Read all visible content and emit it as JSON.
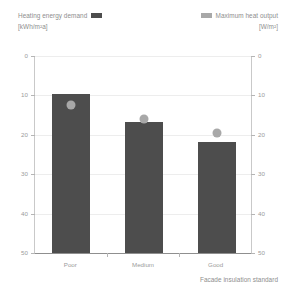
{
  "legend": {
    "left": {
      "label": "Heating energy demand",
      "unit": "[kWh/m²a]",
      "swatch_color": "#4d4d4d",
      "swatch_name": "bar-series-swatch"
    },
    "right": {
      "label": "Maximum heat output",
      "unit": "[W/m²]",
      "swatch_color": "#a8a8a8",
      "swatch_name": "point-series-swatch"
    }
  },
  "axes": {
    "x_title": "Facade insulation standard",
    "left_ticks": [
      "50",
      "40",
      "30",
      "20",
      "10",
      "0"
    ],
    "right_ticks": [
      "50",
      "40",
      "30",
      "20",
      "10",
      "0"
    ]
  },
  "categories": [
    "Poor",
    "Medium",
    "Good"
  ],
  "chart_data": {
    "type": "bar",
    "title": "",
    "subtitle": "",
    "xlabel": "Facade insulation standard",
    "ylabel": "Heating energy demand [kWh/m²a]",
    "y2label": "Maximum heat output [W/m²]",
    "categories": [
      "Poor",
      "Medium",
      "Good"
    ],
    "ylim": [
      0,
      50
    ],
    "y2lim": [
      0,
      50
    ],
    "yticks": [
      0,
      10,
      20,
      30,
      40,
      50
    ],
    "y2ticks": [
      0,
      10,
      20,
      30,
      40,
      50
    ],
    "grid": true,
    "legend_position": "top",
    "series": [
      {
        "name": "Heating energy demand",
        "unit": "kWh/m²a",
        "mark": "bar",
        "axis": "left",
        "color": "#4d4d4d",
        "values": [
          40.3,
          33.3,
          28.3
        ]
      },
      {
        "name": "Maximum heat output",
        "unit": "W/m²",
        "mark": "point",
        "axis": "right",
        "color": "#a8a8a8",
        "values": [
          37.5,
          34.0,
          30.5
        ]
      }
    ]
  }
}
